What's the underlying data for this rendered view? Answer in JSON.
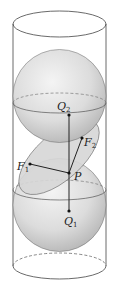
{
  "figure": {
    "labels": {
      "Q2": {
        "main": "Q",
        "sub": "2"
      },
      "F2": {
        "main": "F",
        "sub": "2"
      },
      "F1": {
        "main": "F",
        "sub": "1"
      },
      "P": {
        "main": "P",
        "sub": ""
      },
      "Q1": {
        "main": "Q",
        "sub": "1"
      }
    },
    "colors": {
      "outline": "#333333",
      "sphere_light": "#f2f2f2",
      "sphere_dark": "#b8b8b8",
      "plane_fill": "#d9d9d9"
    }
  }
}
